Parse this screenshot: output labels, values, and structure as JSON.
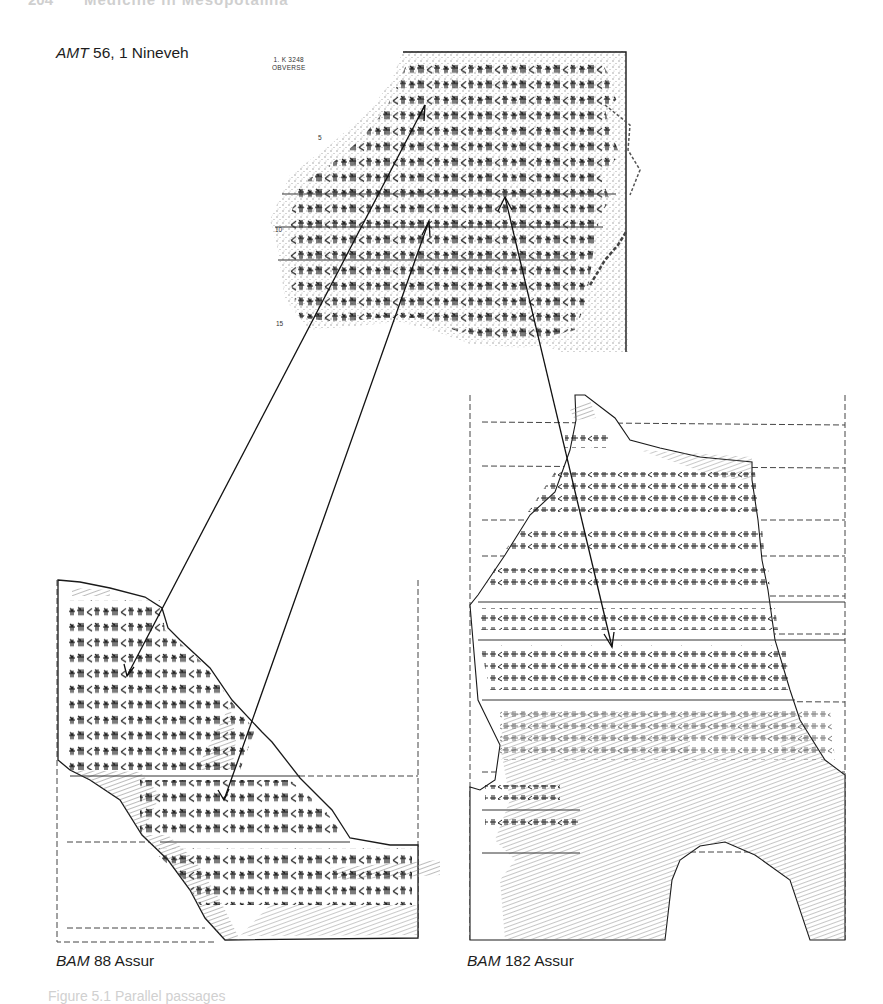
{
  "page": {
    "running_head_number": "204",
    "running_head_title": "Medicine in Mesopotamia",
    "caption": "Figure 5.1  Parallel passages"
  },
  "figure": {
    "top_tablet": {
      "label_italic": "AMT",
      "label_rest": " 56, 1 Nineveh",
      "museum_number_line1": "1.  K 3248",
      "museum_number_line2": "OBVERSE",
      "line_numbers": [
        "5",
        "10",
        "15"
      ]
    },
    "bottom_left_tablet": {
      "label_italic": "BAM",
      "label_rest": " 88 Assur"
    },
    "bottom_right_tablet": {
      "label_italic": "BAM",
      "label_rest": " 182 Assur"
    },
    "arrows": [
      {
        "from": "AMT 56, 1 line 4",
        "to": "BAM 88 line 5"
      },
      {
        "from": "AMT 56, 1 line 10",
        "to": "BAM 88 line 10"
      },
      {
        "from": "AMT 56, 1 line 8",
        "to": "BAM 182 line 9"
      }
    ],
    "colors": {
      "ink": "#1a1a1a",
      "paper": "#ffffff",
      "hatch": "#8a8a8a",
      "stipple": "#9a9a9a"
    }
  }
}
